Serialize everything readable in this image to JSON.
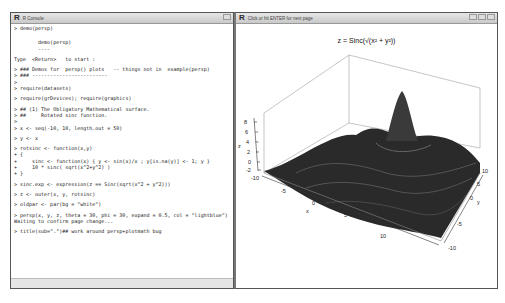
{
  "console_window": {
    "title": "R Console",
    "lines": [
      "> demo(persp)",
      "",
      "",
      "        demo(persp)",
      "        ----",
      "",
      "Type  <Return>   to start :",
      "",
      "> ### Demos for  persp() plots   -- things not in  example(persp)",
      "> ### -------------------------",
      ">",
      "> require(datasets)",
      "",
      "> require(grDevices); require(graphics)",
      "",
      "> ## (1) The Obligatory Mathematical surface.",
      "> ##     Rotated sinc function.",
      ">",
      "> x <- seq(-10, 10, length.out = 50)",
      "",
      "> y <- x",
      "",
      "> rotsinc <- function(x,y)",
      "+ {",
      "+     sinc <- function(x) { y <- sin(x)/x ; y[is.na(y)] <- 1; y }",
      "+     10 * sinc( sqrt(x^2+y^2) )",
      "+ }",
      "",
      "> sinc.exp <- expression(z == Sinc(sqrt(x^2 + y^2)))",
      "",
      "> z <- outer(x, y, rotsinc)",
      "",
      "> oldpar <- par(bg = \"white\")",
      "",
      "> persp(x, y, z, theta = 30, phi = 30, expand = 0.5, col = \"lightblue\")",
      "Waiting to confirm page change...",
      "",
      "> title(sub=\".\")## work around persp+plotmath bug"
    ]
  },
  "graphics_window": {
    "title": "Click or hit ENTER for next page",
    "plot_title": "z = Sinc(√(x² + y²))",
    "z_axis": {
      "label": "z",
      "ticks": [
        "-2",
        "0",
        "2",
        "4",
        "6",
        "8"
      ]
    },
    "x_axis": {
      "label": "x",
      "ticks": [
        "-10",
        "-5",
        "0",
        "5",
        "10"
      ]
    },
    "y_axis": {
      "label": "y",
      "ticks": [
        "-10",
        "-5",
        "0",
        "5",
        "10"
      ]
    }
  },
  "colors": {
    "surface": "#1e1e1e",
    "box": "#999999",
    "titlebar": "#d4d4d4"
  }
}
